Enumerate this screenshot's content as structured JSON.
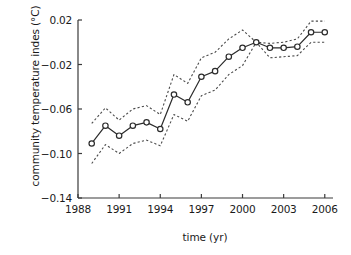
{
  "chart_data": {
    "type": "line",
    "title": "",
    "xlabel": "time (yr)",
    "ylabel": "community temperature indes (°C)",
    "xlim": [
      1988,
      2006.6
    ],
    "ylim": [
      -0.14,
      0.02
    ],
    "xticks": [
      1988,
      1991,
      1994,
      1997,
      2000,
      2003,
      2006
    ],
    "xtick_labels": [
      "1988",
      "1991",
      "1994",
      "1997",
      "2000",
      "2003",
      "2006"
    ],
    "yticks": [
      0.02,
      -0.02,
      -0.06,
      -0.1,
      -0.14
    ],
    "ytick_labels": [
      "0.02",
      "−0.02",
      "−0.06",
      "−0.10",
      "−0.14"
    ],
    "grid": false,
    "legend": null,
    "marker": "open-circle",
    "line_style": "solid",
    "band_style": "dotted",
    "x": [
      1989,
      1990,
      1991,
      1992,
      1993,
      1994,
      1995,
      1996,
      1997,
      1998,
      1999,
      2000,
      2001,
      2002,
      2003,
      2004,
      2005,
      2006
    ],
    "series": [
      {
        "name": "community temperature index",
        "values": [
          -0.091,
          -0.075,
          -0.084,
          -0.075,
          -0.072,
          -0.078,
          -0.047,
          -0.054,
          -0.031,
          -0.026,
          -0.013,
          -0.005,
          0.0,
          -0.005,
          -0.005,
          -0.004,
          0.009,
          0.009
        ]
      },
      {
        "name": "upper confidence limit",
        "values": [
          -0.073,
          -0.059,
          -0.07,
          -0.06,
          -0.057,
          -0.065,
          -0.029,
          -0.037,
          -0.014,
          -0.009,
          0.003,
          0.011,
          0.0,
          -0.001,
          0.0,
          0.003,
          0.019,
          0.019
        ]
      },
      {
        "name": "lower confidence limit",
        "values": [
          -0.109,
          -0.092,
          -0.1,
          -0.091,
          -0.088,
          -0.093,
          -0.065,
          -0.071,
          -0.048,
          -0.043,
          -0.029,
          -0.021,
          0.0,
          -0.014,
          -0.013,
          -0.012,
          0.0,
          0.0
        ]
      }
    ]
  },
  "axes": {
    "y_title": "community temperature indes (°C)",
    "x_title": "time (yr)"
  },
  "colors": {
    "line": "#2b2b2b",
    "band": "#4a4a4a",
    "axis": "#3a3a3a",
    "text": "#1a1a1a",
    "background": "#ffffff"
  }
}
